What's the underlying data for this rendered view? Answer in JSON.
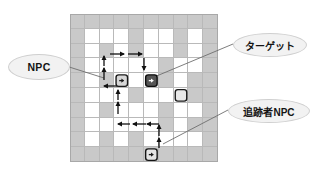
{
  "figure": {
    "type": "grid-maze-diagram",
    "title": "",
    "background_color": "#ffffff"
  },
  "grid": {
    "columns": 10,
    "rows": 10,
    "wall_color": "#c9c9c9",
    "open_color": "#ffffff",
    "line_color": "#b9b9b9",
    "legend": {
      "wall": "wall-cell",
      "open": "open-cell"
    },
    "cells": [
      [
        "w",
        "w",
        "w",
        "w",
        "w",
        "w",
        "w",
        "w",
        "w",
        "w"
      ],
      [
        "w",
        "o",
        "o",
        "o",
        "w",
        "o",
        "o",
        "w",
        "o",
        "w"
      ],
      [
        "w",
        "o",
        "w",
        "o",
        "w",
        "o",
        "o",
        "w",
        "o",
        "w"
      ],
      [
        "w",
        "o",
        "o",
        "o",
        "o",
        "o",
        "w",
        "o",
        "o",
        "w"
      ],
      [
        "w",
        "o",
        "w",
        "o",
        "o",
        "o",
        "w",
        "o",
        "w",
        "w"
      ],
      [
        "w",
        "o",
        "o",
        "o",
        "w",
        "o",
        "o",
        "o",
        "w",
        "w"
      ],
      [
        "w",
        "o",
        "w",
        "o",
        "o",
        "o",
        "w",
        "o",
        "o",
        "w"
      ],
      [
        "w",
        "o",
        "o",
        "o",
        "o",
        "o",
        "w",
        "o",
        "w",
        "w"
      ],
      [
        "w",
        "o",
        "w",
        "o",
        "w",
        "o",
        "o",
        "o",
        "o",
        "w"
      ],
      [
        "w",
        "w",
        "w",
        "w",
        "w",
        "w",
        "w",
        "w",
        "w",
        "w"
      ]
    ]
  },
  "entities": [
    {
      "id": "npc",
      "name": "npc-token",
      "kind": "npc",
      "style": "light-rounded-square",
      "fill": "#d6d6d6",
      "stroke": "#1a1a1a",
      "col": 3,
      "row": 4,
      "has_inner_arrow": true,
      "inner_arrow_direction": "right"
    },
    {
      "id": "target",
      "name": "target-token",
      "kind": "target",
      "style": "dark-rounded-square",
      "fill": "#555555",
      "stroke": "#0d0d0d",
      "col": 5,
      "row": 4,
      "has_inner_arrow": true,
      "inner_arrow_direction": "right"
    },
    {
      "id": "empty-marker",
      "name": "empty-cell-marker",
      "kind": "marker",
      "style": "outline-rounded-square",
      "fill": "#e8e8e8",
      "stroke": "#1a1a1a",
      "col": 7,
      "row": 5,
      "has_inner_arrow": false,
      "inner_arrow_direction": ""
    },
    {
      "id": "chaser",
      "name": "chaser-npc-token",
      "kind": "chaser-npc",
      "style": "light-rounded-square",
      "fill": "#e4e4e4",
      "stroke": "#141414",
      "col": 5,
      "row": 9,
      "has_inner_arrow": true,
      "inner_arrow_direction": "right"
    }
  ],
  "paths": {
    "color": "#111111",
    "segments": [
      {
        "name": "npc-patrol-up-left",
        "x1": 104,
        "y1": 80,
        "x2": 104,
        "y2": 68
      },
      {
        "name": "npc-patrol-up-left-2",
        "x1": 104,
        "y1": 66,
        "x2": 104,
        "y2": 56
      },
      {
        "name": "npc-patrol-top-right",
        "x1": 110,
        "y1": 54,
        "x2": 124,
        "y2": 54
      },
      {
        "name": "npc-patrol-top-right2",
        "x1": 128,
        "y1": 54,
        "x2": 142,
        "y2": 54
      },
      {
        "name": "npc-patrol-down-right",
        "x1": 144,
        "y1": 58,
        "x2": 144,
        "y2": 70
      },
      {
        "name": "npc-patrol-left",
        "x1": 118,
        "y1": 86,
        "x2": 104,
        "y2": 86
      },
      {
        "name": "chaser-route-up-1",
        "x1": 118,
        "y1": 100,
        "x2": 118,
        "y2": 90
      },
      {
        "name": "chaser-route-up-2",
        "x1": 118,
        "y1": 114,
        "x2": 118,
        "y2": 102
      },
      {
        "name": "chaser-route-left-1",
        "x1": 130,
        "y1": 124,
        "x2": 118,
        "y2": 124
      },
      {
        "name": "chaser-route-left-2",
        "x1": 146,
        "y1": 124,
        "x2": 133,
        "y2": 124
      },
      {
        "name": "chaser-route-left-3",
        "x1": 159,
        "y1": 124,
        "x2": 147,
        "y2": 124
      },
      {
        "name": "chaser-route-up-3",
        "x1": 159,
        "y1": 136,
        "x2": 159,
        "y2": 125
      },
      {
        "name": "chaser-route-up-4",
        "x1": 159,
        "y1": 148,
        "x2": 159,
        "y2": 138
      }
    ]
  },
  "leaders": {
    "color": "#6e6e6e",
    "lines": [
      {
        "name": "leader-npc",
        "x1": 66,
        "y1": 66,
        "x2": 104,
        "y2": 78
      },
      {
        "name": "leader-target",
        "x1": 233,
        "y1": 44,
        "x2": 147,
        "y2": 80
      },
      {
        "name": "leader-chaser",
        "x1": 228,
        "y1": 110,
        "x2": 163,
        "y2": 144
      }
    ]
  },
  "labels": {
    "npc": {
      "text": "NPC",
      "name": "label-npc"
    },
    "target": {
      "text": "ターゲット",
      "name": "label-target"
    },
    "chaser": {
      "text": "追跡者NPC",
      "name": "label-chaser-npc"
    }
  }
}
